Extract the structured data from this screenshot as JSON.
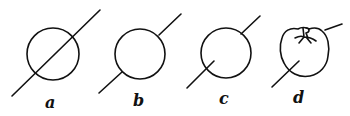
{
  "figures": [
    {
      "id": "a",
      "label": "a",
      "description": "circle with line passing fully through it"
    },
    {
      "id": "b",
      "label": "b",
      "description": "circle with line entering and exiting, hidden inside"
    },
    {
      "id": "c",
      "label": "c",
      "description": "circle with line partially entering from lower left"
    },
    {
      "id": "d",
      "label": "d",
      "description": "tomato with line partially entering from lower left"
    }
  ],
  "colors": {
    "ink": "#111111",
    "background": "#ffffff"
  }
}
